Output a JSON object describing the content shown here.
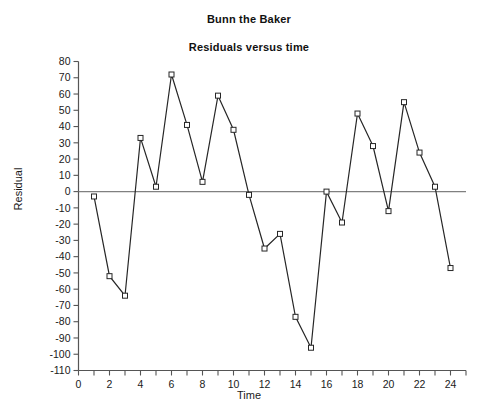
{
  "chart_data": {
    "type": "line",
    "title": "Bunn the Baker",
    "subtitle": "Residuals versus time",
    "xlabel": "Time",
    "ylabel": "Residual",
    "x": [
      1,
      2,
      3,
      4,
      5,
      6,
      7,
      8,
      9,
      10,
      11,
      12,
      13,
      14,
      15,
      16,
      17,
      18,
      19,
      20,
      21,
      22,
      23,
      24
    ],
    "values": [
      -3,
      -52,
      -64,
      33,
      3,
      72,
      41,
      6,
      59,
      38,
      -2,
      -35,
      -26,
      -77,
      -96,
      0,
      -19,
      48,
      28,
      -12,
      55,
      24,
      3,
      -47
    ],
    "series": [
      {
        "name": "Residual",
        "values": [
          -3,
          -52,
          -64,
          33,
          3,
          72,
          41,
          6,
          59,
          38,
          -2,
          -35,
          -26,
          -77,
          -96,
          0,
          -19,
          48,
          28,
          -12,
          55,
          24,
          3,
          -47
        ]
      }
    ],
    "xlim": [
      0,
      25
    ],
    "ylim": [
      -110,
      80
    ],
    "ytick_step": 10,
    "xtick_step": 2,
    "xtick_minor_step": 1,
    "grid": false,
    "legend": "none",
    "marker": "open-square",
    "zero_line": true,
    "line_color": "#262626",
    "marker_edge_color": "#262626",
    "marker_face_color": "#ffffff",
    "zero_line_color": "#808080",
    "axis_color": "#555555",
    "yticks": [
      80,
      70,
      60,
      50,
      40,
      30,
      20,
      10,
      0,
      -10,
      -20,
      -30,
      -40,
      -50,
      -60,
      -70,
      -80,
      -90,
      -100,
      -110
    ],
    "ytick_labels": [
      "80",
      "70",
      "60",
      "50",
      "40",
      "30",
      "20",
      "10",
      "0",
      "-10",
      "-20",
      "-30",
      "-40",
      "-50",
      "-60",
      "-70",
      "-80",
      "-90",
      "-100",
      "-110"
    ],
    "xticks": [
      0,
      2,
      4,
      6,
      8,
      10,
      12,
      14,
      16,
      18,
      20,
      22,
      24
    ],
    "xtick_labels": [
      "0",
      "2",
      "4",
      "6",
      "8",
      "10",
      "12",
      "14",
      "16",
      "18",
      "20",
      "22",
      "24"
    ]
  }
}
